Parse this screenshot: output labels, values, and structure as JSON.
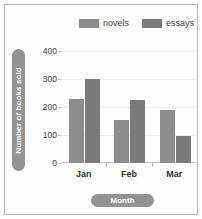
{
  "chart_data": {
    "type": "bar",
    "title": "",
    "xlabel": "Month",
    "ylabel": "Number of books sold",
    "categories": [
      "Jan",
      "Feb",
      "Mar"
    ],
    "series": [
      {
        "name": "novels",
        "color": "#8d8d8d",
        "values": [
          230,
          155,
          190
        ]
      },
      {
        "name": "essays",
        "color": "#7b7b7b",
        "values": [
          300,
          225,
          95
        ]
      }
    ],
    "ylim": [
      0,
      400
    ],
    "yticks": [
      0,
      100,
      200,
      300,
      400
    ],
    "ytick_labels": [
      "0",
      "100",
      "200",
      "300",
      "400"
    ],
    "grid": true,
    "legend_position": "top"
  },
  "legend": {
    "items": [
      {
        "label": "novels",
        "color": "#8d8d8d"
      },
      {
        "label": "essays",
        "color": "#7b7b7b"
      }
    ]
  },
  "axes": {
    "y_axis_title": "Number of books sold",
    "x_axis_title": "Month"
  },
  "colors": {
    "novels": "#8d8d8d",
    "essays": "#7b7b7b",
    "pill": "#939393",
    "gridline": "#e9edf0",
    "frame": "#b9b9b9"
  }
}
